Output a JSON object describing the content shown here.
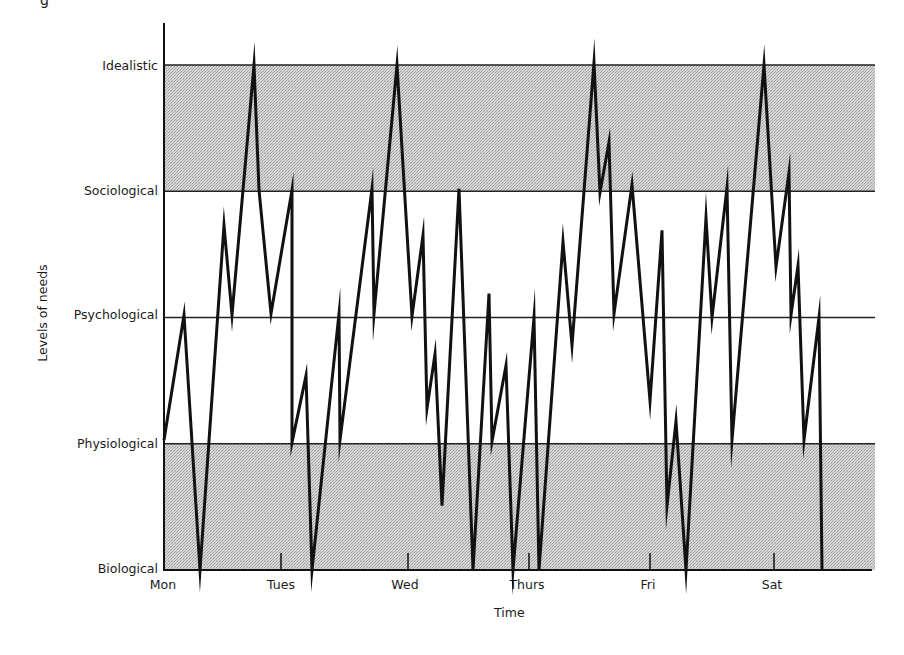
{
  "top_fragment": "g",
  "chart_data": {
    "type": "line",
    "title": "",
    "xlabel": "Time",
    "ylabel": "Levels of needs",
    "y_levels": [
      "Biological",
      "Physiological",
      "Psychological",
      "Sociological",
      "Idealistic"
    ],
    "y_level_values": [
      0,
      1,
      2,
      3,
      4
    ],
    "x_ticks": [
      {
        "label": "Mon",
        "day": 0,
        "px": 164
      },
      {
        "label": "Tues",
        "day": 1,
        "px": 281
      },
      {
        "label": "Wed",
        "day": 2,
        "px": 408
      },
      {
        "label": "Thurs",
        "day": 3,
        "px": 529
      },
      {
        "label": "Fri",
        "day": 4,
        "px": 650
      },
      {
        "label": "Sat",
        "day": 5,
        "px": 774
      }
    ],
    "shaded_bands": [
      {
        "from_level": 3,
        "to_level": 4,
        "color": "#c9c9c9"
      },
      {
        "from_level": 0,
        "to_level": 1,
        "color": "#c9c9c9"
      }
    ],
    "grid": "horizontal lines at each need level",
    "legend": null,
    "series": [
      {
        "name": "Need level over time",
        "color": "#111111",
        "points_px_x": [
          164,
          184,
          200,
          224,
          232,
          254,
          259,
          271,
          292,
          292,
          306,
          312,
          339,
          340,
          372,
          374,
          397,
          412,
          423,
          427,
          435,
          442,
          459,
          473,
          489,
          492,
          506,
          513,
          534,
          539,
          563,
          572,
          594,
          600,
          609,
          614,
          632,
          650,
          662,
          667,
          676,
          686,
          706,
          712,
          727,
          732,
          764,
          776,
          789,
          791,
          798,
          804,
          819,
          822
        ],
        "levels": [
          1.03,
          2.02,
          0,
          2.73,
          2.02,
          4,
          3.01,
          2.03,
          3.01,
          1.01,
          1.54,
          0,
          2.03,
          1.03,
          3.02,
          2.03,
          4,
          2.01,
          2.65,
          1.28,
          1.71,
          0.51,
          3.02,
          0,
          2.19,
          1.02,
          1.62,
          0,
          2.0,
          0,
          2.6,
          1.78,
          4.02,
          2.99,
          3.39,
          2.03,
          3.05,
          1.34,
          2.69,
          0.51,
          1.18,
          0,
          2.79,
          2.0,
          3.03,
          1.03,
          4,
          2.4,
          3.15,
          2.02,
          2.41,
          1.03,
          2.0,
          0
        ]
      }
    ],
    "layout": {
      "axis_x_px": 164,
      "axis_top_px": 23,
      "baseline_px": 570,
      "level_spacing_px": 126.25,
      "plot_right_px": 875
    }
  }
}
